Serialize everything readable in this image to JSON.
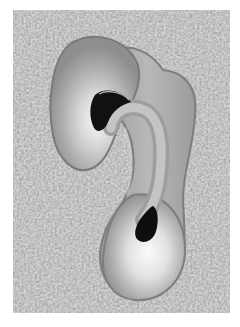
{
  "image": {
    "description": "Grayscale micrograph of a curved, hook-shaped specimen with two dark cavities, on a speckled granular background",
    "palette": {
      "background_light": "#c8c8c8",
      "background_dark": "#5a5a5a",
      "specimen_edge": "#8a8a8a",
      "specimen_body": "#a9a9a9",
      "specimen_highlight": "#f4f4f4",
      "cavity": "#111111",
      "page": "#ffffff"
    }
  }
}
